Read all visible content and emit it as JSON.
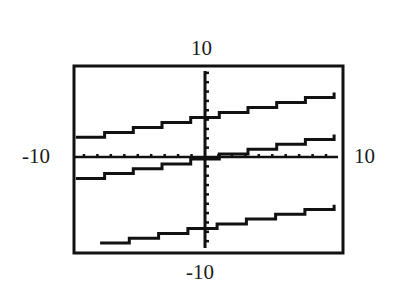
{
  "chart_data": {
    "type": "line",
    "title": "",
    "xlabel": "",
    "ylabel": "",
    "xlim": [
      -10,
      10
    ],
    "ylim": [
      -10,
      10
    ],
    "grid": false,
    "legend": null,
    "axis_window_labels": {
      "top": "10",
      "bottom": "-10",
      "left": "-10",
      "right": "10"
    },
    "tick_scale": 1,
    "series": [
      {
        "name": "line-1",
        "slope": 0.25,
        "intercept": 4.5,
        "x": [
          -9.6,
          9.6
        ],
        "y": [
          2.1,
          6.9
        ]
      },
      {
        "name": "line-2",
        "slope": 0.25,
        "intercept": 0,
        "x": [
          -9.6,
          9.6
        ],
        "y": [
          -2.3,
          2.4
        ]
      },
      {
        "name": "line-3",
        "slope": 0.25,
        "intercept": -7.5,
        "x": [
          -7.8,
          9.6
        ],
        "y": [
          -9.2,
          -5.1
        ]
      }
    ]
  },
  "labels": {
    "top": "10",
    "bottom": "-10",
    "left": "-10",
    "right": "10"
  },
  "colors": {
    "ink": "#111111",
    "background": "#ffffff"
  }
}
